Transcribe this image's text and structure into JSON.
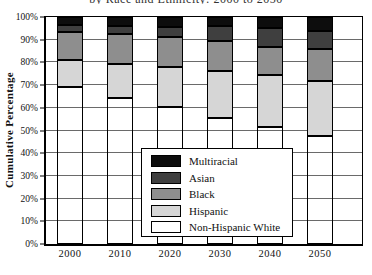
{
  "clipped_title": "by Race and Ethnicity: 2000 to 2050",
  "chart_data": {
    "type": "bar",
    "subtype": "stacked-vertical",
    "title": "",
    "xlabel": "",
    "ylabel": "Cumulative Percentage",
    "ylim": [
      0,
      100
    ],
    "grid": true,
    "legend_position": "center-inside-box",
    "y_ticks": [
      "0%",
      "10%",
      "20%",
      "30%",
      "40%",
      "50%",
      "60%",
      "70%",
      "80%",
      "90%",
      "100%"
    ],
    "categories": [
      "2000",
      "2010",
      "2020",
      "2030",
      "2040",
      "2050"
    ],
    "series": [
      {
        "name": "Non-Hispanic White",
        "color": "#ffffff",
        "fill": "none",
        "values": [
          69,
          64.5,
          60.5,
          55.5,
          51.5,
          47.5
        ]
      },
      {
        "name": "Hispanic",
        "color": "#d6d6d6",
        "values": [
          12,
          15,
          17.5,
          20.5,
          23,
          24.5
        ]
      },
      {
        "name": "Black",
        "color": "#8e8e8e",
        "values": [
          12.5,
          13,
          13,
          13.5,
          12.5,
          14
        ]
      },
      {
        "name": "Asian",
        "color": "#3f3f3f",
        "values": [
          3,
          3.5,
          4.5,
          6.5,
          8,
          8
        ]
      },
      {
        "name": "Multiracial",
        "color": "#0d0d0d",
        "values": [
          3.5,
          4,
          4.5,
          4,
          5,
          6
        ]
      }
    ],
    "cumulative_tops_pct": {
      "2000": [
        69,
        81,
        93.5,
        96.5,
        100
      ],
      "2010": [
        64.5,
        79.5,
        92.5,
        96,
        100
      ],
      "2020": [
        60.5,
        78,
        91,
        95.5,
        100
      ],
      "2030": [
        55.5,
        76,
        89.5,
        95.5,
        100
      ],
      "2040": [
        51.5,
        74.5,
        87,
        95,
        100
      ],
      "2050": [
        47.5,
        72,
        86,
        94,
        100
      ]
    }
  }
}
